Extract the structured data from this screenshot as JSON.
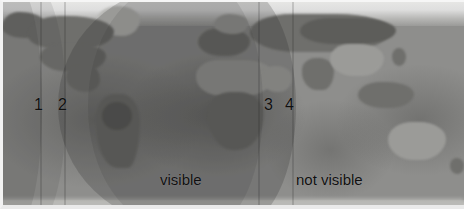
{
  "figure": {
    "name": "satellite-visibility-world-map",
    "projection": "equirectangular-world-map",
    "width": 464,
    "height": 209
  },
  "map": {
    "base_color": "#8e8e8c",
    "land_color": "#6f6f6c",
    "ice_color": "#e4e4e2",
    "ocean_color": "#7e7e7c"
  },
  "overlay": {
    "name": "visibility-footprint",
    "fill_color": "#242422",
    "opacity": "0.20",
    "right_edge_x": 296
  },
  "labels": {
    "markers": [
      {
        "id": "1",
        "text": "1",
        "x": 34,
        "y": 97
      },
      {
        "id": "2",
        "text": "2",
        "x": 58,
        "y": 97
      },
      {
        "id": "3",
        "text": "3",
        "x": 264,
        "y": 97
      },
      {
        "id": "4",
        "text": "4",
        "x": 285,
        "y": 97
      }
    ],
    "zones": [
      {
        "id": "visible",
        "text": "visible",
        "x": 160,
        "y": 172
      },
      {
        "id": "not-visible",
        "text": "not visible",
        "x": 296,
        "y": 172
      }
    ]
  },
  "regions": {
    "north_america": "North America",
    "south_america": "South America",
    "europe": "Europe",
    "africa": "Africa",
    "asia": "Asia",
    "australia": "Australia",
    "greenland": "Greenland",
    "antarctica": "Antarctica"
  }
}
